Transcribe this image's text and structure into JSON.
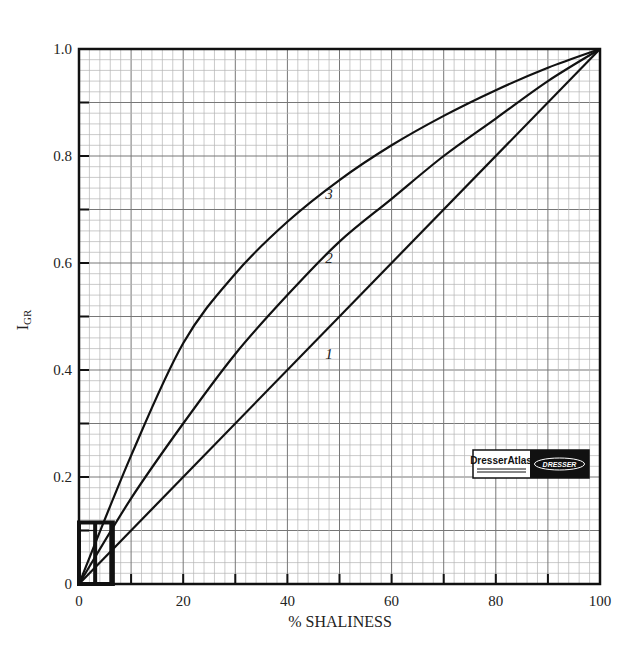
{
  "chart_data": {
    "type": "line",
    "title": "",
    "xlabel": "% SHALINESS",
    "ylabel": "I",
    "ylabel_subscript": "GR",
    "xlim": [
      0,
      100
    ],
    "ylim": [
      0,
      1.0
    ],
    "grid": true,
    "x_ticks": [
      "0",
      "20",
      "40",
      "60",
      "80",
      "100"
    ],
    "y_ticks": [
      "0",
      "0.2",
      "0.4",
      "0.6",
      "0.8",
      "1.0"
    ],
    "x": [
      0,
      10,
      20,
      30,
      40,
      50,
      60,
      70,
      80,
      90,
      100
    ],
    "series": [
      {
        "name": "1",
        "values": [
          0,
          0.1,
          0.2,
          0.3,
          0.4,
          0.5,
          0.6,
          0.7,
          0.8,
          0.9,
          1.0
        ]
      },
      {
        "name": "2",
        "values": [
          0,
          0.16,
          0.3,
          0.43,
          0.54,
          0.64,
          0.72,
          0.8,
          0.87,
          0.94,
          1.0
        ]
      },
      {
        "name": "3",
        "values": [
          0,
          0.24,
          0.45,
          0.58,
          0.677,
          0.755,
          0.82,
          0.875,
          0.923,
          0.965,
          1.0
        ]
      }
    ],
    "curve_labels": [
      {
        "text": "1",
        "x": 48,
        "y": 0.42
      },
      {
        "text": "2",
        "x": 48,
        "y": 0.6
      },
      {
        "text": "3",
        "x": 48,
        "y": 0.72
      }
    ],
    "annotations": [
      {
        "type": "inset-box",
        "x_range": [
          0,
          6.5
        ],
        "y_range": [
          0,
          0.115
        ],
        "inner_verticals": [
          3.1,
          6.2
        ]
      }
    ],
    "logo": {
      "left_text": "DresserAtlas",
      "right_text": "DRESSER"
    }
  }
}
